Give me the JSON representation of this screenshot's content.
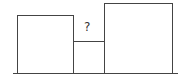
{
  "diagram": {
    "question_label": "?",
    "shapes": [
      {
        "name": "left-square",
        "x": 17,
        "y": 15,
        "w": 56,
        "h": 58
      },
      {
        "name": "middle-rectangle",
        "x": 73,
        "y": 41,
        "w": 31,
        "h": 32
      },
      {
        "name": "right-square",
        "x": 104,
        "y": 3,
        "w": 68,
        "h": 70
      }
    ],
    "baseline": {
      "x1": 13,
      "x2": 178,
      "y": 73
    },
    "stroke_color": "#444444"
  }
}
